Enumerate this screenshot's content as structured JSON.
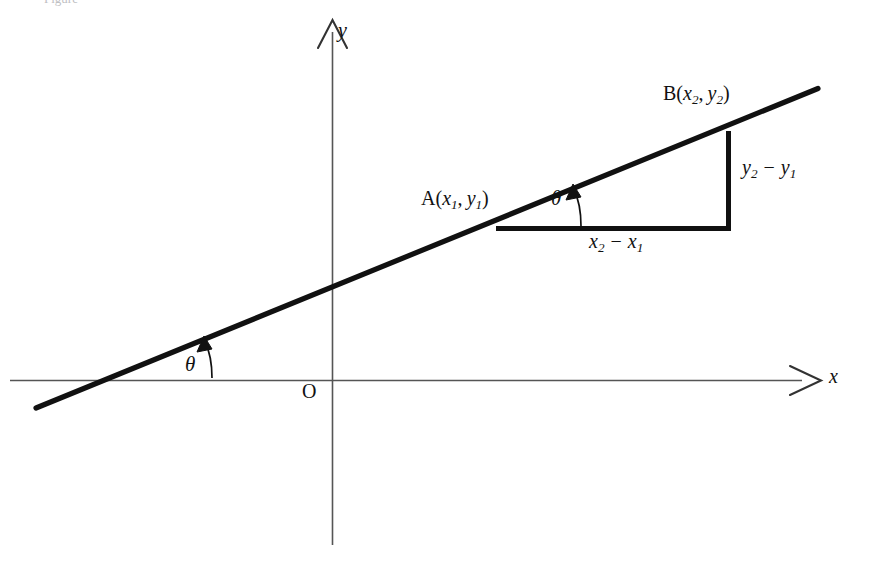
{
  "figure": {
    "caption_fragment": "Figure",
    "background_color": "#ffffff",
    "line_color": "#111111",
    "axis_color": "#555555"
  },
  "axes": {
    "x_label": "x",
    "y_label": "y",
    "origin_label": "O",
    "x_axis": {
      "y": 380,
      "x_start": 10,
      "x_end": 800,
      "arrow": "open-right"
    },
    "y_axis": {
      "x": 332,
      "y_start": 30,
      "y_end": 545,
      "arrow": "open-up"
    }
  },
  "points": {
    "a": {
      "label_letter": "A",
      "coord_x": "x",
      "coord_x_sub": "1",
      "coord_y": "y",
      "coord_y_sub": "1",
      "position": {
        "x": 497,
        "y": 228
      }
    },
    "b": {
      "label_letter": "B",
      "coord_x": "x",
      "coord_x_sub": "2",
      "coord_y": "y",
      "coord_y_sub": "2",
      "position": {
        "x": 728,
        "y": 133
      }
    }
  },
  "triangle": {
    "rise_label": {
      "var": "y",
      "sub_a": "2",
      "minus": "−",
      "sub_b": "1"
    },
    "run_label": {
      "var": "x",
      "sub_a": "2",
      "minus": "−",
      "sub_b": "1"
    },
    "corner": {
      "x": 728,
      "y": 228
    }
  },
  "angles": {
    "theta_symbol": "θ",
    "at_origin": {
      "x": 192,
      "y": 364
    },
    "at_point_a": {
      "x": 558,
      "y": 198
    }
  },
  "line": {
    "start": {
      "x": 36,
      "y": 408
    },
    "end": {
      "x": 817,
      "y": 89
    },
    "stroke_width": 5
  }
}
